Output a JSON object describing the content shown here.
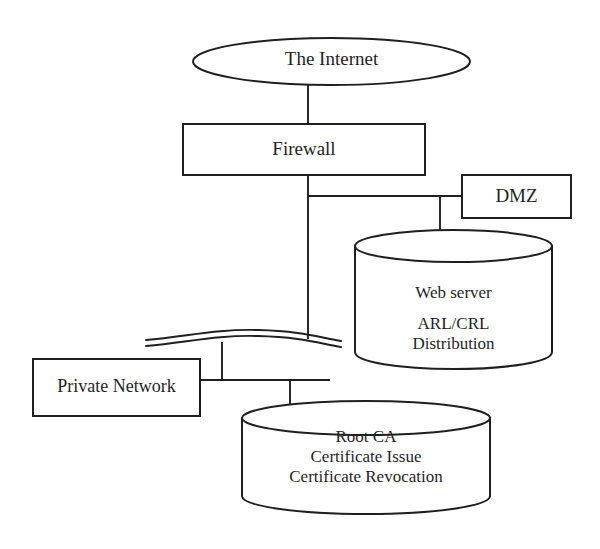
{
  "diagram": {
    "type": "network-topology-diagram",
    "stroke_color": "#1f1f1f",
    "fill_color": "#ffffff",
    "background_color": "#ffffff",
    "nodes": [
      {
        "id": "internet",
        "shape": "ellipse",
        "label": "The Internet",
        "lines": [
          "The Internet"
        ]
      },
      {
        "id": "firewall",
        "shape": "rectangle",
        "label": "Firewall",
        "lines": [
          "Firewall"
        ]
      },
      {
        "id": "dmz",
        "shape": "rectangle",
        "label": "DMZ",
        "lines": [
          "DMZ"
        ]
      },
      {
        "id": "web-server",
        "shape": "cylinder",
        "label": "Web server ARL/CRL Distribution",
        "lines": [
          "Web server",
          "ARL/CRL",
          "Distribution"
        ]
      },
      {
        "id": "private-network",
        "shape": "rectangle",
        "label": "Private Network",
        "lines": [
          "Private Network"
        ]
      },
      {
        "id": "root-ca",
        "shape": "cylinder",
        "label": "Root CA Certificate Issue Certificate Revocation",
        "lines": [
          "Root CA",
          "Certificate Issue",
          "Certificate Revocation"
        ]
      },
      {
        "id": "network-bus",
        "shape": "wavy-double-line",
        "label": ""
      }
    ],
    "labels": {
      "internet": "The Internet",
      "firewall": "Firewall",
      "dmz": "DMZ",
      "web_server_line1": "Web server",
      "web_server_line2": "ARL/CRL",
      "web_server_line3": "Distribution",
      "private_network": "Private Network",
      "root_ca_line1": "Root CA",
      "root_ca_line2": "Certificate Issue",
      "root_ca_line3": "Certificate Revocation"
    },
    "connections": [
      {
        "from": "internet",
        "to": "firewall"
      },
      {
        "from": "firewall",
        "to": "network-bus"
      },
      {
        "from": "firewall",
        "to": "dmz"
      },
      {
        "from": "dmz-link",
        "to": "web-server"
      },
      {
        "from": "private-network",
        "to": "network-bus"
      },
      {
        "from": "private-network",
        "to": "root-ca"
      }
    ]
  }
}
